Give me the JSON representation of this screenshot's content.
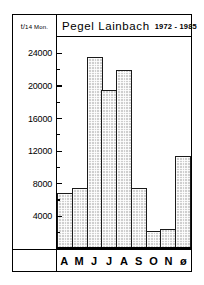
{
  "chart_data": {
    "type": "bar",
    "title": "Pegel Lainbach",
    "title_years": "1972 - 1985",
    "ylabel": "t/14 Mon.",
    "ylabel_prefix": "t/",
    "ylabel_suffix": "14 Mon.",
    "xlabel": "",
    "categories": [
      "A",
      "M",
      "J",
      "J",
      "A",
      "S",
      "O",
      "N",
      "ø"
    ],
    "values": [
      6900,
      7500,
      23500,
      19500,
      22000,
      7500,
      2200,
      2500,
      11400
    ],
    "ylim": [
      0,
      26000
    ],
    "yticks": [
      4000,
      8000,
      12000,
      16000,
      20000,
      24000
    ],
    "ytick_labels": [
      "4000",
      "8000",
      "12000",
      "16000",
      "20000",
      "24000"
    ],
    "yminor_step": 2000,
    "grid": false,
    "legend": null
  },
  "colors": {
    "bar_fill": "#cfcfcf",
    "bar_edge": "#1a1a1a",
    "frame": "#000000",
    "background": "#ffffff"
  }
}
